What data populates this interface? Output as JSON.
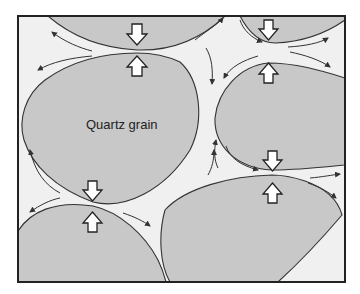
{
  "diagram": {
    "labels": {
      "grain": "Quartz grain"
    },
    "colors": {
      "pore_space": "#f0f0f0",
      "grain_fill": "#c8c8c8",
      "outline": "#333333",
      "arrow_fill": "#ffffff"
    },
    "grains": [
      {
        "id": "top-left",
        "label": ""
      },
      {
        "id": "top-right",
        "label": ""
      },
      {
        "id": "center-left",
        "label": "Quartz grain"
      },
      {
        "id": "right",
        "label": ""
      },
      {
        "id": "bottom-left",
        "label": ""
      },
      {
        "id": "bottom-right",
        "label": ""
      }
    ],
    "contact_points": [
      {
        "x": 137,
        "y": 50,
        "description": "compression arrows pointing toward contact"
      },
      {
        "x": 268,
        "y": 45,
        "description": "compression arrows pointing toward contact"
      },
      {
        "x": 272,
        "y": 172,
        "description": "compression arrows pointing toward contact"
      },
      {
        "x": 93,
        "y": 205,
        "description": "compression arrows pointing toward contact"
      }
    ]
  }
}
